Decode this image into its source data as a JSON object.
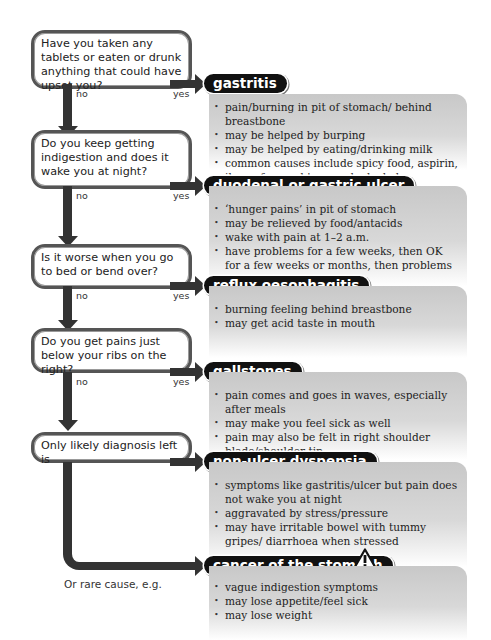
{
  "questions": [
    {
      "text": "Have you taken any tablets or eaten or drunk anything that could have upset you?"
    },
    {
      "text": "Do you keep getting indigestion and does it wake you at night?"
    },
    {
      "text": "Is it worse when you go to bed or bend over?"
    },
    {
      "text": "Do you get pains just below your ribs on the right?"
    },
    {
      "text": "Only likely diagnosis left is"
    }
  ],
  "labels": {
    "no": "no",
    "yes": "yes",
    "rare_cause": "Or rare cause, e.g."
  },
  "diagnoses": [
    {
      "title": "gastritis",
      "items": [
        "pain/burning in pit of stomach/ behind breastbone",
        "may be helped by burping",
        "may be helped by eating/drinking milk",
        "common causes include spicy food, aspirin, ibuprofen, and too much alcohol"
      ]
    },
    {
      "title": "duodenal or gastric ulcer",
      "items": [
        "‘hunger pains’ in pit of stomach",
        "may be relieved by food/antacids",
        "wake with pain at 1–2 a.m.",
        "have problems for a few weeks, then OK for a few weeks or months, then problems again"
      ]
    },
    {
      "title": "reflux oesophagitis",
      "items": [
        "burning feeling behind breastbone",
        "may get acid taste in mouth"
      ]
    },
    {
      "title": "gallstones",
      "items": [
        "pain comes and goes in waves, especially after meals",
        "may make you feel sick as well",
        "pain may also be felt in right shoulder blade/shoulder tip"
      ]
    },
    {
      "title": "non-ulcer dyspepsia",
      "items": [
        "symptoms like gastritis/ulcer but pain does not wake you at night",
        "aggravated by stress/pressure",
        "may have irritable bowel with tummy gripes/ diarrhoea when stressed"
      ]
    },
    {
      "title": "cancer of the stomach",
      "icon": "warning-icon",
      "items": [
        "vague indigestion symptoms",
        "may lose appetite/feel sick",
        "may lose weight"
      ]
    }
  ],
  "colors": {
    "arrow": "#333333",
    "pill_bg": "#111111",
    "box_bg": "#d0d0d0"
  }
}
